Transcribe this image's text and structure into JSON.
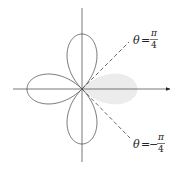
{
  "figure": {
    "curve": "r = cos(2θ)",
    "shaded_region": {
      "theta_from": "-π/4",
      "theta_to": "π/4"
    },
    "colors": {
      "curve": "#555555",
      "axes": "#555555",
      "shade": "#ececec",
      "dashed": "#444444"
    }
  },
  "labels": {
    "upper_ray": {
      "lhs": "θ",
      "eq": "=",
      "sign": "",
      "num": "π",
      "den": "4"
    },
    "lower_ray": {
      "lhs": "θ",
      "eq": "=",
      "sign": "−",
      "num": "π",
      "den": "4"
    }
  }
}
